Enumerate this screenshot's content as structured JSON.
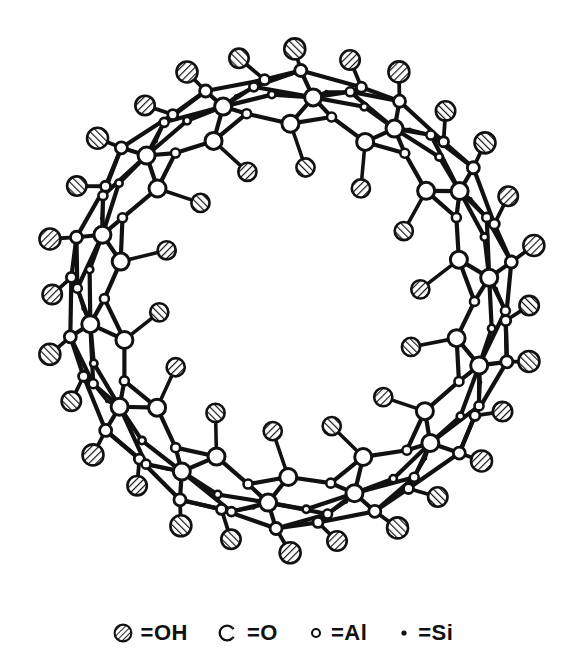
{
  "figure": {
    "background_color": "#ffffff",
    "line_color": "#111111",
    "hatch_color": "#111111"
  },
  "legend": {
    "items": [
      {
        "symbol": "hatched-circle",
        "equals": "=OH",
        "species": "OH",
        "size": 19
      },
      {
        "symbol": "open-circle-gap",
        "equals": "=O",
        "species": "O",
        "size": 17
      },
      {
        "symbol": "small-open-circle",
        "equals": "=Al",
        "species": "Al",
        "size": 9
      },
      {
        "symbol": "filled-dot",
        "equals": "=Si",
        "species": "Si",
        "size": 5
      }
    ]
  },
  "structure": {
    "type": "annular-ring",
    "center_x": 290,
    "center_y": 300,
    "lumen_radius": 112,
    "outer_radius": 258,
    "repeat_units": 14,
    "description": "Ring of Al-O-Si coordination polyhedra with OH groups lining both outer surface and inner lumen",
    "radii": {
      "oh_inner": 132,
      "o_inner": 172,
      "al_inner": 186,
      "o_mid": 200,
      "al_mid": 214,
      "si_mid": 206,
      "o_outer": 224,
      "al_outer": 226,
      "oh_outer": 248
    },
    "counts": {
      "oh_inner": 14,
      "oh_outer": 28,
      "o_nodes": 42,
      "al_nodes": 28,
      "si_nodes": 14
    },
    "atom_sizes": {
      "oh": 21,
      "o": 17,
      "al": 9,
      "si": 4
    },
    "bond_width": 4.2
  }
}
